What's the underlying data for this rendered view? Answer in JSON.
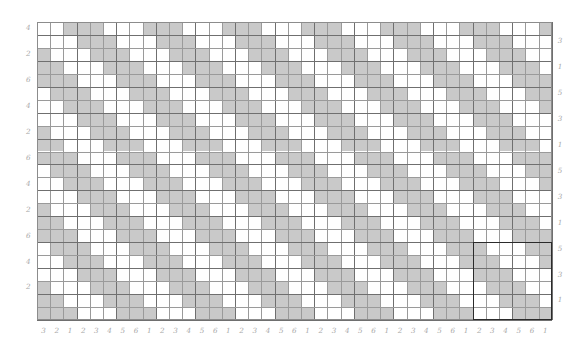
{
  "figure": {
    "kind": "weave-drawdown",
    "title": "",
    "colors": {
      "filled": "#c9c9c9",
      "empty": "#ffffff",
      "gridline": "#9a9a9a",
      "gridline_major": "#6f6f6f",
      "frame": "#8c8c8c",
      "repeat_box": "#2b2b2b",
      "label": "#a8a8a8"
    },
    "geometry": {
      "left": 37,
      "top": 22,
      "cell_w": 13.2,
      "cell_h": 12.95,
      "cols": 39,
      "rows": 23
    },
    "repeat_box": {
      "col_start": 33,
      "row_start": 17,
      "cols": 6,
      "rows": 6
    }
  },
  "chart_data": {
    "type": "heatmap",
    "title": "",
    "xlabel": "",
    "ylabel": "",
    "grid": true,
    "legend": "none",
    "note": "Binary weave drawdown. 1 = filled (warp up / gray), 0 = empty (weft up / white). 39 columns x 23 rows. Underlying repeat unit is 6 x 6.",
    "repeat_unit": {
      "cols": 6,
      "rows": 6,
      "matrix": [
        [
          0,
          0,
          1,
          1,
          1,
          0
        ],
        [
          0,
          0,
          0,
          1,
          1,
          1
        ],
        [
          1,
          0,
          0,
          0,
          1,
          1
        ],
        [
          1,
          1,
          0,
          0,
          0,
          1
        ],
        [
          1,
          1,
          1,
          0,
          0,
          0
        ],
        [
          0,
          1,
          1,
          1,
          0,
          0
        ]
      ]
    },
    "x_tick_labels": [
      "1",
      "6",
      "5",
      "4",
      "3",
      "2",
      "1",
      "6",
      "5",
      "4",
      "3",
      "2",
      "1",
      "6",
      "5",
      "4",
      "3",
      "2",
      "1",
      "6",
      "5",
      "4",
      "3",
      "2",
      "1",
      "6",
      "5",
      "4",
      "3",
      "2",
      "1",
      "6",
      "5",
      "4",
      "3",
      "2",
      "1"
    ],
    "y_left_tick_labels": [
      "4",
      "2",
      "6",
      "4",
      "2",
      "6",
      "4",
      "2",
      "6",
      "4",
      "2"
    ],
    "y_right_tick_labels": [
      "3",
      "1",
      "5",
      "3",
      "1",
      "5",
      "3",
      "1",
      "5",
      "3",
      "1"
    ],
    "axis_label_cycle_x": [
      "6",
      "5",
      "4",
      "3",
      "2",
      "1"
    ],
    "axis_label_cycle_y_left": [
      "6",
      "4",
      "2"
    ],
    "axis_label_cycle_y_right": [
      "5",
      "3",
      "1"
    ]
  }
}
